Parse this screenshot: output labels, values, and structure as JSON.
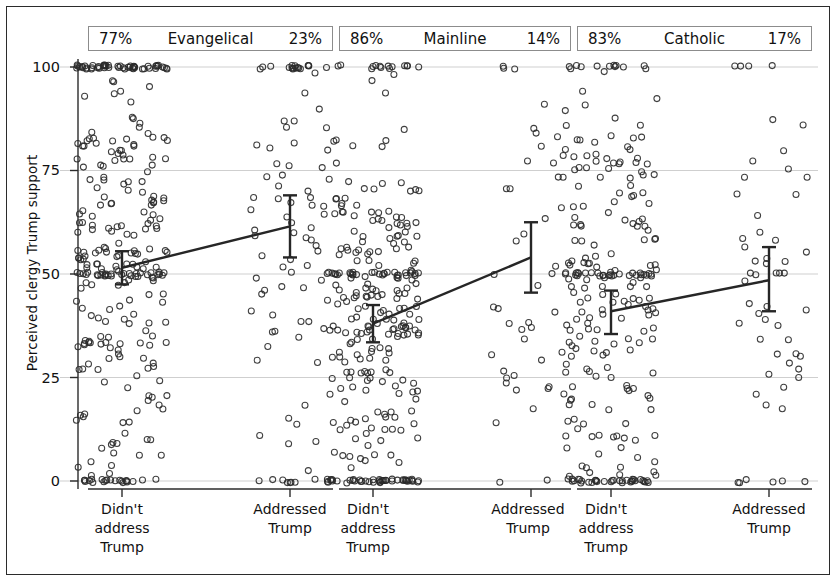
{
  "chart_data": {
    "type": "scatter",
    "title": "",
    "xlabel": "",
    "ylabel": "Perceived clergy Trump support",
    "ylim": [
      0,
      100
    ],
    "yticks": [
      0,
      25,
      50,
      75,
      100
    ],
    "ytick_labels": [
      "0",
      "25",
      "50",
      "75",
      "100"
    ],
    "grid": true,
    "legend": "none",
    "categories": [
      "Didn't address Trump",
      "Addressed Trump"
    ],
    "panels": [
      {
        "name": "Evangelical",
        "left_pct": "77%",
        "right_pct": "23%",
        "means": [
          51.5,
          61.5
        ],
        "ci_low": [
          47.5,
          54.0
        ],
        "ci_high": [
          55.5,
          69.0
        ],
        "n_left": 310,
        "n_right": 93
      },
      {
        "name": "Mainline",
        "left_pct": "86%",
        "right_pct": "14%",
        "means": [
          38.0,
          54.0
        ],
        "ci_low": [
          33.5,
          45.5
        ],
        "ci_high": [
          42.5,
          62.5
        ],
        "n_left": 300,
        "n_right": 50
      },
      {
        "name": "Catholic",
        "left_pct": "83%",
        "right_pct": "17%",
        "means": [
          41.0,
          48.5
        ],
        "ci_low": [
          35.5,
          41.0
        ],
        "ci_high": [
          46.0,
          56.5
        ],
        "n_left": 250,
        "n_right": 55
      }
    ],
    "marker": "open-circle",
    "marker_color": "#2a2a2a",
    "line_color": "#262626",
    "grid_color": "#cfcfcf",
    "axis_color": "#2b2b2b"
  },
  "axis": {
    "y_title": "Perceived clergy Trump support",
    "y_ticks": [
      "100",
      "75",
      "50",
      "25",
      "0"
    ],
    "x_cat_left_line1": "Didn't",
    "x_cat_left_line2": "address",
    "x_cat_left_line3": "Trump",
    "x_cat_right_line1": "Addressed",
    "x_cat_right_line2": "Trump"
  },
  "panel_headers": [
    {
      "left": "77%",
      "center": "Evangelical",
      "right": "23%"
    },
    {
      "left": "86%",
      "center": "Mainline",
      "right": "14%"
    },
    {
      "left": "83%",
      "center": "Catholic",
      "right": "17%"
    }
  ]
}
